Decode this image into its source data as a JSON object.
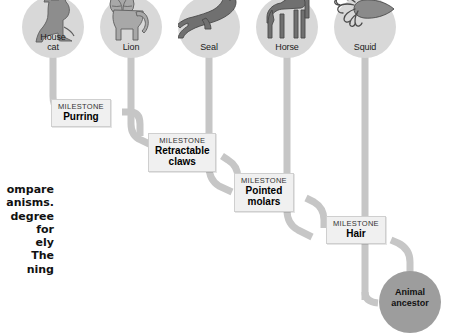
{
  "figure": {
    "type": "cladogram",
    "ancestor": {
      "label": "Animal\nancestor",
      "label_line1": "Animal",
      "label_line2": "ancestor",
      "color": "#9d9d9d"
    },
    "node_color": "#d8d8d8",
    "branch_color": "#c6c6c6",
    "milestone_kicker": "MILESTONE"
  },
  "taxa": [
    {
      "id": "house-cat",
      "label_line1": "House",
      "label_line2": "cat",
      "icon": "cat-icon"
    },
    {
      "id": "lion",
      "label_line1": "Lion",
      "label_line2": "",
      "icon": "lion-icon"
    },
    {
      "id": "seal",
      "label_line1": "Seal",
      "label_line2": "",
      "icon": "seal-icon"
    },
    {
      "id": "horse",
      "label_line1": "Horse",
      "label_line2": "",
      "icon": "horse-icon"
    },
    {
      "id": "squid",
      "label_line1": "Squid",
      "label_line2": "",
      "icon": "squid-icon"
    }
  ],
  "milestones": [
    {
      "id": "purring",
      "kicker": "MILESTONE",
      "line1": "Purring",
      "line2": ""
    },
    {
      "id": "retractable-claws",
      "kicker": "MILESTONE",
      "line1": "Retractable",
      "line2": "claws"
    },
    {
      "id": "pointed-molars",
      "kicker": "MILESTONE",
      "line1": "Pointed",
      "line2": "molars"
    },
    {
      "id": "hair",
      "kicker": "MILESTONE",
      "line1": "Hair",
      "line2": ""
    }
  ],
  "body_copy": {
    "note": "Paragraph clipped by the left edge of the screenshot; only line endings are visible.",
    "lines": [
      "ompare",
      "anisms.",
      "degree",
      "for",
      "ely",
      "The",
      "ning"
    ]
  }
}
